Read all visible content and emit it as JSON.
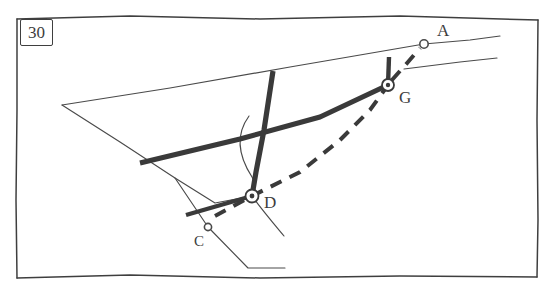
{
  "figure": {
    "number_label": "30",
    "kind": "hand-drawn-geometry-sketch",
    "ink_color": "#3a3a3a",
    "thin_ink_color": "#4a4a4a",
    "background": "#ffffff",
    "frame": {
      "label": "sketch-frame",
      "left": 16,
      "top": 17,
      "right": 538,
      "bottom": 277
    }
  },
  "points": [
    {
      "id": "A",
      "label": "A",
      "marker": "open-circle",
      "x": 424,
      "y": 44,
      "label_x": 437,
      "label_y": 36
    },
    {
      "id": "G",
      "label": "G",
      "marker": "ringed-dot",
      "x": 388,
      "y": 85,
      "label_x": 399,
      "label_y": 103
    },
    {
      "id": "D",
      "label": "D",
      "marker": "ringed-dot",
      "x": 252,
      "y": 196,
      "label_x": 264,
      "label_y": 208
    },
    {
      "id": "C",
      "label": "C",
      "marker": "open-circle",
      "x": 208,
      "y": 227,
      "label_x": 194,
      "label_y": 246
    }
  ],
  "strokes": {
    "thin_lines": [
      {
        "name": "upper-plane-edge",
        "d": "M 62 105 L 170 88 L 290 67 L 360 55 L 424 44"
      },
      {
        "name": "lower-plane-edge",
        "d": "M 62 105 L 120 142 L 175 178 L 215 203 L 252 196"
      },
      {
        "name": "ray-A-right-upper",
        "d": "M 424 44 L 470 40 L 500 36"
      },
      {
        "name": "ray-A-right-lower",
        "d": "M 404 69 L 460 62 L 497 58"
      },
      {
        "name": "line-through-C",
        "d": "M 175 178 L 208 227 L 248 268 L 285 268"
      },
      {
        "name": "curve-through-D",
        "d": "M 249 116 C 233 138 241 160 252 177 C 258 186 252 191 252 196"
      },
      {
        "name": "curve-below-D",
        "d": "M 252 196 C 262 210 274 224 284 236"
      }
    ],
    "thick_lines": [
      {
        "name": "thick-band-to-G",
        "d": "M 140 163 L 240 139 L 320 117 L 388 85"
      },
      {
        "name": "thick-vertical-mid",
        "d": "M 273 71 L 264 130 L 256 172 L 252 196"
      },
      {
        "name": "thick-vertical-G",
        "d": "M 389 57 L 388 85"
      },
      {
        "name": "thick-stub-left-D",
        "d": "M 186 215 L 252 196"
      }
    ],
    "dashed_lines": [
      {
        "name": "dashed-D-to-G",
        "d": "M 215 216 L 252 196 L 300 172 L 340 140 L 370 110 L 388 85"
      },
      {
        "name": "dashed-G-to-A",
        "d": "M 392 80 L 408 62 L 420 48"
      }
    ]
  },
  "annotations": {
    "box_label": "30"
  }
}
